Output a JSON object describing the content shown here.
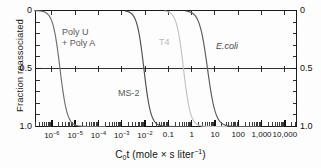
{
  "figure": {
    "ylabel": "Fraction reassociated",
    "xtitle_main": "C",
    "xtitle_sub": "0",
    "xtitle_rest": "t (mole × s liter",
    "xtitle_sup": "−1",
    "xtitle_close": ")"
  },
  "chart_data": {
    "type": "line",
    "title": "",
    "xlabel": "C0t (mole × s liter−1)",
    "ylabel": "Fraction reassociated",
    "xscale": "log",
    "xlim": [
      -6.7,
      4.5
    ],
    "ylim": [
      0,
      1
    ],
    "y_inverted": true,
    "grid": false,
    "legend": "inline-annotations",
    "x_tick_labels": [
      "10−6",
      "10−5",
      "10−4",
      "10−3",
      "10−2",
      "0.1",
      "1",
      "10",
      "100",
      "1,000",
      "10,000"
    ],
    "x_tick_exponents": [
      -6,
      -5,
      -4,
      -3,
      -2,
      -1,
      0,
      1,
      2,
      3,
      4
    ],
    "y_tick_labels": [
      "0",
      "0.5",
      "1.0"
    ],
    "y_tick_values": [
      0,
      0.5,
      1.0
    ],
    "minor_ticks": "log-decades 2-9",
    "series": [
      {
        "name": "Poly U + Poly A",
        "label": "Poly U",
        "label2": "+ Poly A",
        "color": "#6e6e6e",
        "midpoint_log10": -5.65,
        "width_decades": 1.55,
        "points_log10_x": [
          -6.75,
          -6.5,
          -6.25,
          -6.0,
          -5.9,
          -5.8,
          -5.65,
          -5.5,
          -5.4,
          -5.25,
          -5.0,
          -4.8,
          -4.6
        ],
        "points_y": [
          0.02,
          0.07,
          0.15,
          0.3,
          0.37,
          0.44,
          0.5,
          0.6,
          0.67,
          0.77,
          0.89,
          0.95,
          0.985
        ]
      },
      {
        "name": "MS-2",
        "label": "MS-2",
        "color": "#4f4f4f",
        "midpoint_log10": -2.05,
        "width_decades": 1.5,
        "points_log10_x": [
          -3.35,
          -3.1,
          -2.85,
          -2.6,
          -2.4,
          -2.2,
          -2.05,
          -1.9,
          -1.75,
          -1.55,
          -1.35,
          -1.15,
          -0.95
        ],
        "points_y": [
          0.01,
          0.04,
          0.1,
          0.2,
          0.3,
          0.42,
          0.5,
          0.59,
          0.68,
          0.8,
          0.89,
          0.95,
          0.99
        ]
      },
      {
        "name": "T4",
        "label": "T4",
        "color": "#c2c2c2",
        "midpoint_log10": -0.35,
        "width_decades": 1.5,
        "points_log10_x": [
          -1.6,
          -1.35,
          -1.1,
          -0.9,
          -0.7,
          -0.5,
          -0.35,
          -0.2,
          -0.05,
          0.15,
          0.35,
          0.55,
          0.7
        ],
        "points_y": [
          0.01,
          0.04,
          0.11,
          0.2,
          0.31,
          0.43,
          0.5,
          0.58,
          0.67,
          0.79,
          0.88,
          0.95,
          0.98
        ]
      },
      {
        "name": "E.coli",
        "label": "E.coli",
        "color": "#5a5a5a",
        "midpoint_log10": 0.68,
        "width_decades": 1.75,
        "points_log10_x": [
          -0.7,
          -0.4,
          -0.15,
          0.1,
          0.3,
          0.5,
          0.68,
          0.85,
          1.05,
          1.3,
          1.55,
          1.8,
          2.05
        ],
        "points_y": [
          0.01,
          0.04,
          0.1,
          0.2,
          0.3,
          0.42,
          0.5,
          0.58,
          0.68,
          0.8,
          0.89,
          0.95,
          0.99
        ]
      }
    ]
  },
  "annotations": {
    "poly_line1": "Poly U",
    "poly_line2": "+ Poly A",
    "ms2": "MS-2",
    "t4": "T4",
    "ecoli": "E.coli"
  },
  "axes": {
    "left_labels": [
      "0",
      "0.5",
      "1.0"
    ],
    "right_labels": [
      "0",
      "0.5",
      "1.0"
    ]
  },
  "colors": {
    "axis": "#1a1a1a",
    "curve_dark": "#4f4f4f",
    "curve_light": "#c2c2c2",
    "text": "#111111"
  }
}
